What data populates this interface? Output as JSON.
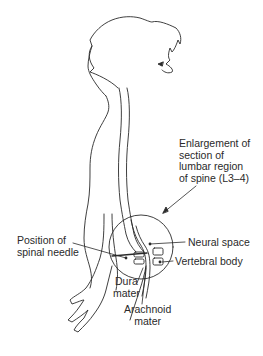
{
  "diagram": {
    "labels": {
      "enlargement": "Enlargement of\nsection of\nlumbar region\nof spine (L3–4)",
      "needle": "Position of\nspinal needle",
      "neural_space": "Neural space",
      "vertebral_body": "Vertebral body",
      "dura_mater": "Dura\nmater",
      "arachnoid_mater": "Arachnoid\nmater"
    },
    "colors": {
      "line": "#2a2a2a",
      "background": "#ffffff"
    }
  }
}
